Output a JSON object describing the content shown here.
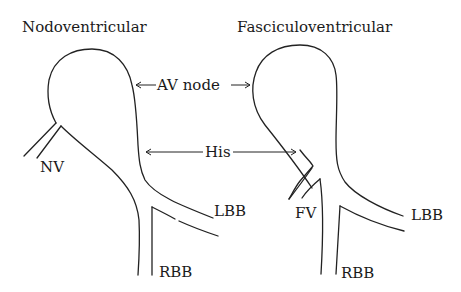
{
  "diagram": {
    "left_panel": {
      "title": "Nodoventricular",
      "labels": {
        "tract": "NV",
        "lbb": "LBB",
        "rbb": "RBB"
      }
    },
    "right_panel": {
      "title": "Fasciculoventricular",
      "labels": {
        "tract": "FV",
        "lbb": "LBB",
        "rbb": "RBB"
      }
    },
    "shared_labels": {
      "av_node": "AV node",
      "his": "His"
    },
    "colors": {
      "stroke": "#222222",
      "background": "#ffffff"
    }
  }
}
